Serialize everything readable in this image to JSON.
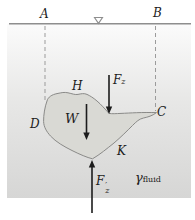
{
  "labels": {
    "surface_left": "A",
    "surface_right": "B",
    "body_top": "H",
    "body_left": "D",
    "body_right": "C",
    "body_bottom_right": "K"
  },
  "forces": {
    "buoy_top": {
      "letter": "F",
      "sub": "z"
    },
    "weight": {
      "letter": "W"
    },
    "buoy_bottom": {
      "letter": "F",
      "prime": "′",
      "sub": "z"
    }
  },
  "fluid": {
    "gamma": "γ",
    "sub": "fluid"
  },
  "icons": {
    "free_surface_symbol": "inverted-triangle"
  },
  "colors": {
    "surface_line": "#8e8e8e",
    "dashed_line": "#9b9b9b",
    "body_fill": "#d9d9d4",
    "body_stroke": "#8a8a88",
    "fluid_top": "#fbfbfb",
    "fluid_mid": "#e7e7e6",
    "fluid_bottom": "#d6d6d5",
    "ink": "#1c1c1c",
    "background": "#ffffff"
  }
}
